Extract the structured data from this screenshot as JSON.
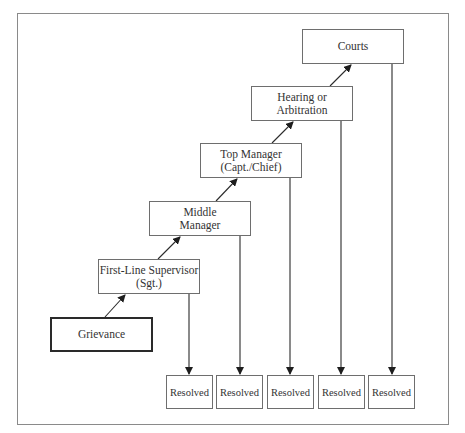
{
  "diagram": {
    "type": "flowchart",
    "title": "",
    "nodes": [
      {
        "id": "grievance",
        "line1": "Grievance",
        "line2": "",
        "emphasis": "thick-border"
      },
      {
        "id": "first-line-supervisor",
        "line1": "First-Line Supervisor",
        "line2": "(Sgt.)"
      },
      {
        "id": "middle-manager",
        "line1": "Middle",
        "line2": "Manager"
      },
      {
        "id": "top-manager",
        "line1": "Top Manager",
        "line2": "(Capt./Chief)"
      },
      {
        "id": "hearing-arbitration",
        "line1": "Hearing or",
        "line2": "Arbitration"
      },
      {
        "id": "courts",
        "line1": "Courts",
        "line2": ""
      }
    ],
    "resolved": [
      {
        "label": "Resolved",
        "from": "first-line-supervisor"
      },
      {
        "label": "Resolved",
        "from": "middle-manager"
      },
      {
        "label": "Resolved",
        "from": "top-manager"
      },
      {
        "label": "Resolved",
        "from": "hearing-arbitration"
      },
      {
        "label": "Resolved",
        "from": "courts"
      }
    ],
    "edges": [
      {
        "from": "grievance",
        "to": "first-line-supervisor"
      },
      {
        "from": "first-line-supervisor",
        "to": "middle-manager"
      },
      {
        "from": "middle-manager",
        "to": "top-manager"
      },
      {
        "from": "top-manager",
        "to": "hearing-arbitration"
      },
      {
        "from": "hearing-arbitration",
        "to": "courts"
      },
      {
        "from": "first-line-supervisor",
        "to": "resolved-1"
      },
      {
        "from": "middle-manager",
        "to": "resolved-2"
      },
      {
        "from": "top-manager",
        "to": "resolved-3"
      },
      {
        "from": "hearing-arbitration",
        "to": "resolved-4"
      },
      {
        "from": "courts",
        "to": "resolved-5"
      }
    ],
    "colors": {
      "line": "#2a2a2a",
      "box_border": "#6e6e6e",
      "frame": "#8a8a8a",
      "background": "#ffffff"
    }
  }
}
